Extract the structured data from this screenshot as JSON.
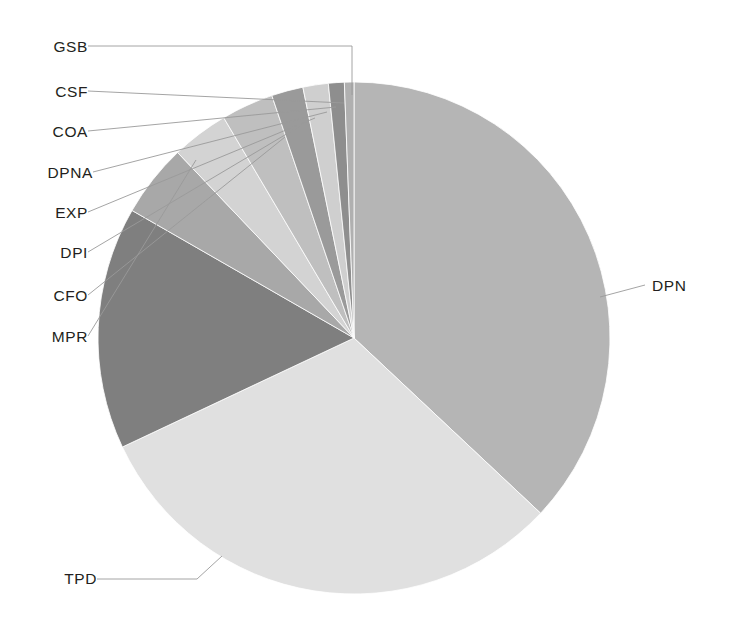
{
  "chart_data": {
    "type": "pie",
    "title": "",
    "legend_position": "none",
    "labels_outside": true,
    "categories": [
      "DPN",
      "TPD",
      "MPR",
      "CFO",
      "DPI",
      "EXP",
      "DPNA",
      "COA",
      "CSF",
      "GSB"
    ],
    "values": [
      37.0,
      31.0,
      15.3,
      4.6,
      3.6,
      3.3,
      2.0,
      1.6,
      1.0,
      0.6
    ],
    "unit": "percent",
    "colors": [
      "#b5b5b5",
      "#e0e0e0",
      "#7f7f7f",
      "#a8a8a8",
      "#d3d3d3",
      "#bfbfbf",
      "#9a9a9a",
      "#cfcfcf",
      "#8e8e8e",
      "#b0b0b0"
    ],
    "start_angle_deg": 0,
    "direction": "clockwise",
    "xlabel": "",
    "ylabel": ""
  },
  "labels": {
    "gsb": "GSB",
    "csf": "CSF",
    "coa": "COA",
    "dpna": "DPNA",
    "exp": "EXP",
    "dpi": "DPI",
    "cfo": "CFO",
    "mpr": "MPR",
    "tpd": "TPD",
    "dpn": "DPN"
  }
}
